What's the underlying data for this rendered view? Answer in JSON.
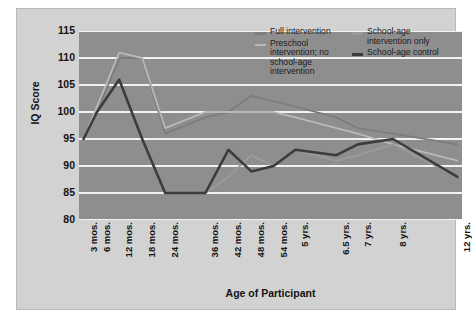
{
  "chart_data": {
    "type": "line",
    "title": "",
    "xlabel": "Age of Participant",
    "ylabel": "IQ Score",
    "ylim": [
      80,
      115
    ],
    "yticks": [
      115,
      110,
      105,
      100,
      95,
      90,
      85,
      80
    ],
    "grid": true,
    "legend_position": "top-right-inside",
    "categories": [
      "3 mos.",
      "6 mos.",
      "12 mos.",
      "18 mos.",
      "24 mos.",
      "36 mos.",
      "42 mos.",
      "48 mos.",
      "54 mos.",
      "5 yrs.",
      "6.5 yrs.",
      "7 yrs.",
      "8 yrs.",
      "12 yrs."
    ],
    "series": [
      {
        "name": "Full intervention",
        "color": "#7d7d7d",
        "values": [
          95,
          100,
          110,
          110,
          96,
          99,
          100,
          103,
          102,
          101,
          99,
          97,
          96,
          94
        ]
      },
      {
        "name": "Preschool intervention; no school-age intervention",
        "color": "#b9b9b9",
        "values": [
          95,
          101,
          111,
          110,
          97,
          100,
          100,
          100,
          100,
          99,
          97,
          96,
          94,
          91
        ]
      },
      {
        "name": "School-age intervention only",
        "color": "#9a9a9a",
        "values": [
          95,
          100,
          106,
          95,
          85,
          85,
          88,
          92,
          90,
          93,
          91,
          92,
          94,
          88
        ]
      },
      {
        "name": "School-age control",
        "color": "#3c3c3c",
        "values": [
          95,
          100,
          106,
          95,
          85,
          85,
          93,
          89,
          90,
          93,
          92,
          94,
          95,
          88
        ]
      }
    ]
  },
  "axis": {
    "y_label": "IQ Score",
    "x_label": "Age of Participant",
    "y_ticks": [
      "115",
      "110",
      "105",
      "100",
      "95",
      "90",
      "85",
      "80"
    ],
    "x_ticks": [
      "3 mos.",
      "6 mos.",
      "12 mos.",
      "18 mos.",
      "24 mos.",
      "36 mos.",
      "42 mos.",
      "48 mos.",
      "54 mos.",
      "5 yrs.",
      "6.5 yrs.",
      "7 yrs.",
      "8 yrs.",
      "12 yrs."
    ]
  },
  "legend": {
    "left_column": [
      {
        "label": "Full intervention",
        "color": "#7d7d7d"
      },
      {
        "label": "Preschool intervention; no school-age intervention",
        "color": "#b9b9b9"
      }
    ],
    "right_column": [
      {
        "label": "School-age intervention only",
        "color": "#9a9a9a"
      },
      {
        "label": "School-age control",
        "color": "#3c3c3c"
      }
    ]
  },
  "colors": {
    "plot_background": "#8e8e8e",
    "figure_background": "#d2d2d2",
    "gridline": "#f2f2f2",
    "text": "#141414"
  }
}
